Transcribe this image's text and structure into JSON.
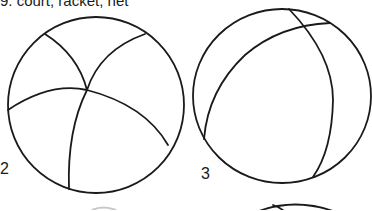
{
  "caption": {
    "text": "9.  court, racket, net"
  },
  "figures": [
    {
      "label": "2",
      "description": "ball with curved seams meeting at one point"
    },
    {
      "label": "3",
      "description": "ball with two crossing seams near the top"
    }
  ],
  "colors": {
    "ink": "#1a1a1a",
    "background": "#ffffff"
  }
}
